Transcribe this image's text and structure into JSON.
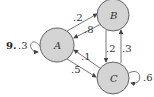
{
  "problem": {
    "number": "9."
  },
  "nodes": [
    {
      "id": "A",
      "label": "A",
      "fill": "#d4d4d4"
    },
    {
      "id": "B",
      "label": "B",
      "fill": "#d4d4d4"
    },
    {
      "id": "C",
      "label": "C",
      "fill": "#d4d4d4"
    }
  ],
  "edges": [
    {
      "from": "A",
      "to": "A",
      "label": ".3"
    },
    {
      "from": "A",
      "to": "B",
      "label": ".2"
    },
    {
      "from": "B",
      "to": "A",
      "label": ".8"
    },
    {
      "from": "B",
      "to": "C",
      "label": ".2"
    },
    {
      "from": "C",
      "to": "B",
      "label": ".3"
    },
    {
      "from": "C",
      "to": "A",
      "label": ".1"
    },
    {
      "from": "A",
      "to": "C",
      "label": ".5"
    },
    {
      "from": "C",
      "to": "C",
      "label": ".6"
    }
  ]
}
